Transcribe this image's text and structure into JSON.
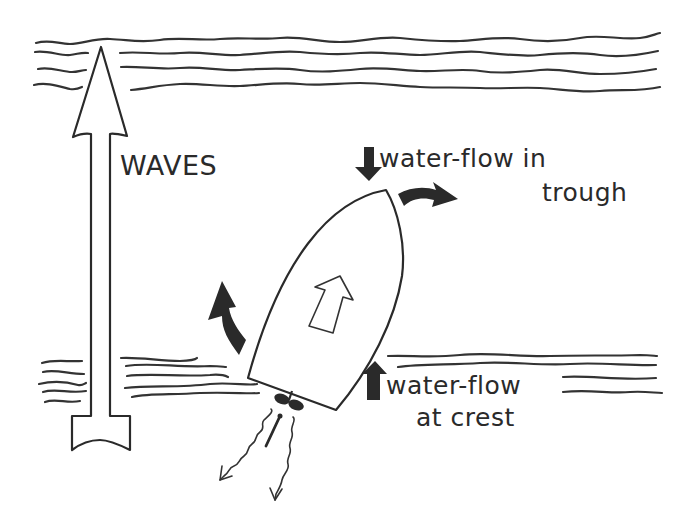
{
  "diagram": {
    "labels": {
      "waves": "WAVES",
      "trough_line1": "water-flow in",
      "trough_line2": "trough",
      "crest_line1": "water-flow",
      "crest_line2": "at crest"
    },
    "elements": [
      {
        "id": "top-wave-band",
        "type": "wavy-lines",
        "count": 4
      },
      {
        "id": "lower-wave-band",
        "type": "wavy-lines",
        "count": 13
      },
      {
        "id": "wave-direction-arrow",
        "type": "hollow-arrow",
        "direction": "up"
      },
      {
        "id": "boat-hull",
        "type": "outline",
        "heading": "up-right"
      },
      {
        "id": "boat-heading-arrow",
        "type": "hollow-arrow"
      },
      {
        "id": "trough-flow-arrow",
        "type": "solid-arrow",
        "direction": "down"
      },
      {
        "id": "crest-flow-arrow",
        "type": "solid-arrow",
        "direction": "up"
      },
      {
        "id": "bow-turn-arrow",
        "type": "curved-solid-arrow",
        "direction": "clockwise-right"
      },
      {
        "id": "stern-turn-arrow",
        "type": "curved-solid-arrow",
        "direction": "up-left"
      },
      {
        "id": "propeller",
        "type": "propeller"
      },
      {
        "id": "rudder",
        "type": "rudder"
      },
      {
        "id": "prop-wash",
        "type": "wavy-arrows",
        "count": 2
      }
    ],
    "colors": {
      "ink": "#2a2a2a",
      "background": "#ffffff"
    }
  }
}
